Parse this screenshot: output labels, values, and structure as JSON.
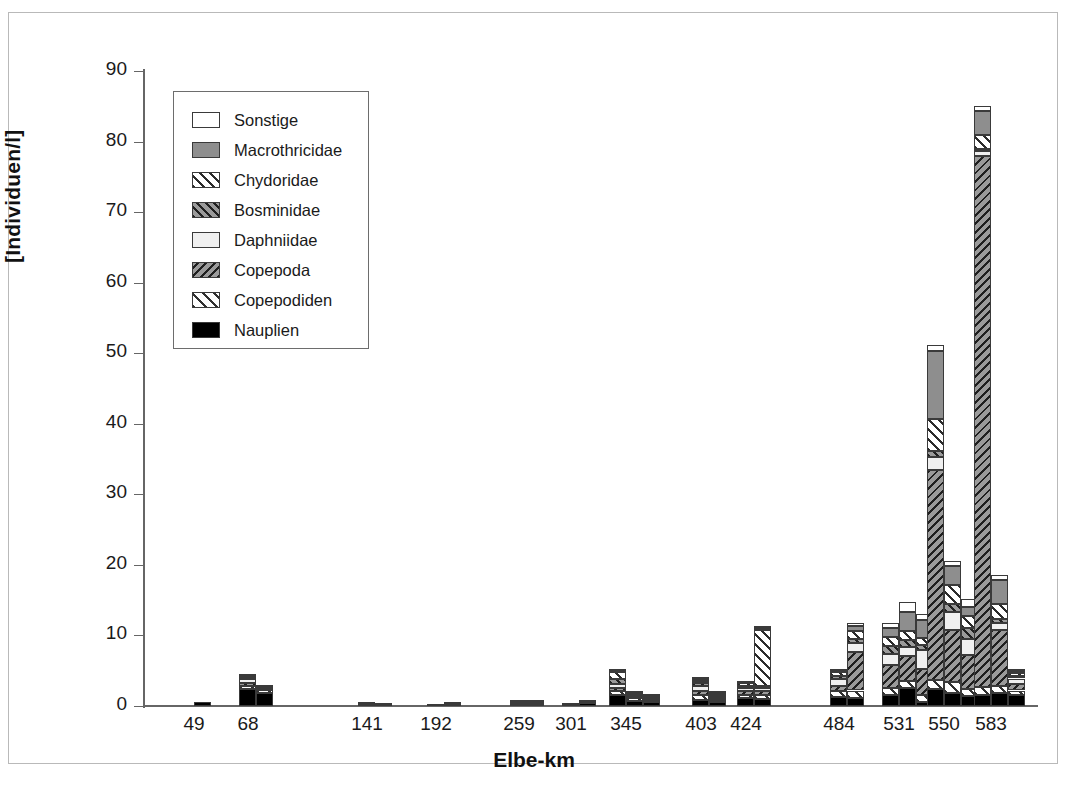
{
  "chart_data": {
    "type": "bar",
    "title": "",
    "subtitle": "",
    "xlabel": "Elbe-km",
    "ylabel": "[Individuen/l]",
    "ylim": [
      0,
      90
    ],
    "yticks": [
      0,
      10,
      20,
      30,
      40,
      50,
      60,
      70,
      80,
      90
    ],
    "grid": false,
    "stacked": true,
    "legend_position": "upper-left",
    "categories": [
      "49",
      "68",
      "141",
      "192",
      "259",
      "301",
      "345",
      "403",
      "424",
      "484",
      "531",
      "550",
      "583"
    ],
    "series": [
      {
        "name": "Sonstige",
        "color": "#ffffff",
        "pattern": "solid"
      },
      {
        "name": "Macrothricidae",
        "color": "#8e8e8e",
        "pattern": "solid"
      },
      {
        "name": "Chydoridae",
        "color": "#ffffff",
        "pattern": "hatch-forward"
      },
      {
        "name": "Bosminidae",
        "color": "#9a9a9a",
        "pattern": "hatch-forward"
      },
      {
        "name": "Daphniidae",
        "color": "#f0f0f0",
        "pattern": "solid"
      },
      {
        "name": "Copepoda",
        "color": "#9a9a9a",
        "pattern": "hatch-back"
      },
      {
        "name": "Copepodiden",
        "color": "#ffffff",
        "pattern": "hatch-forward"
      },
      {
        "name": "Nauplien",
        "color": "#000000",
        "pattern": "solid"
      }
    ],
    "stack_order_bottom_to_top": [
      "Nauplien",
      "Copepodiden",
      "Copepoda",
      "Daphniidae",
      "Bosminidae",
      "Chydoridae",
      "Macrothricidae",
      "Sonstige"
    ],
    "groups": [
      {
        "category": "49",
        "bars": [
          {
            "values": {
              "Nauplien": 0.6,
              "Copepodiden": 0.0,
              "Copepoda": 0.0,
              "Daphniidae": 0.0,
              "Bosminidae": 0.0,
              "Chydoridae": 0.0,
              "Macrothricidae": 0.0,
              "Sonstige": 0.0
            },
            "total": 0.6
          }
        ]
      },
      {
        "category": "68",
        "bars": [
          {
            "values": {
              "Nauplien": 2.4,
              "Copepodiden": 0.5,
              "Copepoda": 0.3,
              "Daphniidae": 0.6,
              "Bosminidae": 0.2,
              "Chydoridae": 0.2,
              "Macrothricidae": 0.0,
              "Sonstige": 0.3
            },
            "total": 4.5
          },
          {
            "values": {
              "Nauplien": 1.9,
              "Copepodiden": 0.4,
              "Copepoda": 0.2,
              "Daphniidae": 0.2,
              "Bosminidae": 0.0,
              "Chydoridae": 0.0,
              "Macrothricidae": 0.0,
              "Sonstige": 0.1
            },
            "total": 2.8
          }
        ]
      },
      {
        "category": "141",
        "bars": [
          {
            "values": {
              "Nauplien": 0.25,
              "Copepodiden": 0.05,
              "Copepoda": 0.0,
              "Daphniidae": 0.0,
              "Bosminidae": 0.0,
              "Chydoridae": 0.0,
              "Macrothricidae": 0.0,
              "Sonstige": 0.0
            },
            "total": 0.3
          },
          {
            "values": {
              "Nauplien": 0.2,
              "Copepodiden": 0.05,
              "Copepoda": 0.0,
              "Daphniidae": 0.0,
              "Bosminidae": 0.0,
              "Chydoridae": 0.0,
              "Macrothricidae": 0.0,
              "Sonstige": 0.0
            },
            "total": 0.25
          }
        ]
      },
      {
        "category": "192",
        "bars": [
          {
            "values": {
              "Nauplien": 0.2,
              "Copepodiden": 0.0,
              "Copepoda": 0.0,
              "Daphniidae": 0.0,
              "Bosminidae": 0.0,
              "Chydoridae": 0.0,
              "Macrothricidae": 0.0,
              "Sonstige": 0.0
            },
            "total": 0.2
          },
          {
            "values": {
              "Nauplien": 0.35,
              "Copepodiden": 0.1,
              "Copepoda": 0.0,
              "Daphniidae": 0.0,
              "Bosminidae": 0.0,
              "Chydoridae": 0.0,
              "Macrothricidae": 0.0,
              "Sonstige": 0.0
            },
            "total": 0.45
          }
        ]
      },
      {
        "category": "259",
        "bars": [
          {
            "values": {
              "Nauplien": 0.35,
              "Copepodiden": 0.1,
              "Copepoda": 0.05,
              "Daphniidae": 0.1,
              "Bosminidae": 0.0,
              "Chydoridae": 0.0,
              "Macrothricidae": 0.0,
              "Sonstige": 0.05
            },
            "total": 0.65
          },
          {
            "values": {
              "Nauplien": 0.3,
              "Copepodiden": 0.1,
              "Copepoda": 0.05,
              "Daphniidae": 0.1,
              "Bosminidae": 0.0,
              "Chydoridae": 0.0,
              "Macrothricidae": 0.0,
              "Sonstige": 0.05
            },
            "total": 0.6
          }
        ]
      },
      {
        "category": "301",
        "bars": [
          {
            "values": {
              "Nauplien": 0.2,
              "Copepodiden": 0.1,
              "Copepoda": 0.0,
              "Daphniidae": 0.0,
              "Bosminidae": 0.0,
              "Chydoridae": 0.0,
              "Macrothricidae": 0.0,
              "Sonstige": 0.0
            },
            "total": 0.3
          },
          {
            "values": {
              "Nauplien": 0.4,
              "Copepodiden": 0.1,
              "Copepoda": 0.05,
              "Daphniidae": 0.0,
              "Bosminidae": 0.0,
              "Chydoridae": 0.0,
              "Macrothricidae": 0.0,
              "Sonstige": 0.0
            },
            "total": 0.55
          }
        ]
      },
      {
        "category": "345",
        "bars": [
          {
            "values": {
              "Nauplien": 1.6,
              "Copepodiden": 0.5,
              "Copepoda": 0.5,
              "Daphniidae": 0.5,
              "Bosminidae": 0.7,
              "Chydoridae": 1.0,
              "Macrothricidae": 0.2,
              "Sonstige": 0.2
            },
            "total": 5.2
          },
          {
            "values": {
              "Nauplien": 0.7,
              "Copepodiden": 0.4,
              "Copepoda": 0.3,
              "Daphniidae": 0.3,
              "Bosminidae": 0.2,
              "Chydoridae": 0.1,
              "Macrothricidae": 0.0,
              "Sonstige": 0.0
            },
            "total": 2.0
          },
          {
            "values": {
              "Nauplien": 0.5,
              "Copepodiden": 0.3,
              "Copepoda": 0.2,
              "Daphniidae": 0.2,
              "Bosminidae": 0.1,
              "Chydoridae": 0.1,
              "Macrothricidae": 0.0,
              "Sonstige": 0.1
            },
            "total": 1.5
          }
        ]
      },
      {
        "category": "403",
        "bars": [
          {
            "values": {
              "Nauplien": 0.9,
              "Copepodiden": 0.6,
              "Copepoda": 0.6,
              "Daphniidae": 0.7,
              "Bosminidae": 0.4,
              "Chydoridae": 0.4,
              "Macrothricidae": 0.2,
              "Sonstige": 0.2
            },
            "total": 4.0
          },
          {
            "values": {
              "Nauplien": 0.5,
              "Copepodiden": 0.3,
              "Copepoda": 0.3,
              "Daphniidae": 0.3,
              "Bosminidae": 0.2,
              "Chydoridae": 0.2,
              "Macrothricidae": 0.0,
              "Sonstige": 0.1
            },
            "total": 1.9
          }
        ]
      },
      {
        "category": "424",
        "bars": [
          {
            "values": {
              "Nauplien": 1.1,
              "Copepodiden": 0.5,
              "Copepoda": 0.5,
              "Daphniidae": 0.5,
              "Bosminidae": 0.3,
              "Chydoridae": 0.3,
              "Macrothricidae": 0.1,
              "Sonstige": 0.1
            },
            "total": 3.4
          },
          {
            "values": {
              "Nauplien": 1.0,
              "Copepodiden": 0.5,
              "Copepoda": 0.6,
              "Daphniidae": 0.4,
              "Bosminidae": 0.3,
              "Chydoridae": 8.0,
              "Macrothricidae": 0.2,
              "Sonstige": 0.2
            },
            "total": 11.2
          }
        ]
      },
      {
        "category": "484",
        "bars": [
          {
            "values": {
              "Nauplien": 1.3,
              "Copepodiden": 0.8,
              "Copepoda": 0.8,
              "Daphniidae": 0.9,
              "Bosminidae": 0.5,
              "Chydoridae": 0.5,
              "Macrothricidae": 0.2,
              "Sonstige": 0.2
            },
            "total": 5.2
          },
          {
            "values": {
              "Nauplien": 1.2,
              "Copepodiden": 1.0,
              "Copepoda": 5.5,
              "Daphniidae": 1.2,
              "Bosminidae": 0.6,
              "Chydoridae": 1.2,
              "Macrothricidae": 0.6,
              "Sonstige": 0.5
            },
            "total": 11.8
          }
        ]
      },
      {
        "category": "531",
        "bars": [
          {
            "values": {
              "Nauplien": 1.6,
              "Copepodiden": 1.0,
              "Copepoda": 3.2,
              "Daphniidae": 1.6,
              "Bosminidae": 1.1,
              "Chydoridae": 1.3,
              "Macrothricidae": 1.2,
              "Sonstige": 0.8
            },
            "total": 11.8
          },
          {
            "values": {
              "Nauplien": 2.6,
              "Copepodiden": 0.9,
              "Copepoda": 3.6,
              "Daphniidae": 1.3,
              "Bosminidae": 0.9,
              "Chydoridae": 1.4,
              "Macrothricidae": 2.6,
              "Sonstige": 1.4
            },
            "total": 14.7
          },
          {
            "values": {
              "Nauplien": 0.6,
              "Copepodiden": 0.9,
              "Copepoda": 3.8,
              "Daphniidae": 2.6,
              "Bosminidae": 0.8,
              "Chydoridae": 0.9,
              "Macrothricidae": 2.6,
              "Sonstige": 0.8
            },
            "total": 13.0
          }
        ]
      },
      {
        "category": "550",
        "bars": [
          {
            "values": {
              "Nauplien": 2.4,
              "Copepodiden": 1.3,
              "Copepoda": 29.8,
              "Daphniidae": 1.8,
              "Bosminidae": 0.9,
              "Chydoridae": 4.5,
              "Macrothricidae": 9.6,
              "Sonstige": 0.8
            },
            "total": 51.1
          },
          {
            "values": {
              "Nauplien": 1.9,
              "Copepodiden": 1.5,
              "Copepoda": 7.4,
              "Daphniidae": 2.5,
              "Bosminidae": 1.1,
              "Chydoridae": 2.7,
              "Macrothricidae": 2.8,
              "Sonstige": 0.6
            },
            "total": 20.5
          },
          {
            "values": {
              "Nauplien": 1.4,
              "Copepodiden": 1.0,
              "Copepoda": 4.8,
              "Daphniidae": 2.3,
              "Bosminidae": 1.6,
              "Chydoridae": 1.6,
              "Macrothricidae": 1.4,
              "Sonstige": 1.1
            },
            "total": 15.2
          }
        ]
      },
      {
        "category": "583",
        "bars": [
          {
            "values": {
              "Nauplien": 1.5,
              "Copepodiden": 1.2,
              "Copepoda": 75.3,
              "Daphniidae": 0.6,
              "Bosminidae": 0.4,
              "Chydoridae": 2.0,
              "Macrothricidae": 3.4,
              "Sonstige": 0.6
            },
            "total": 85.0
          },
          {
            "values": {
              "Nauplien": 1.8,
              "Copepodiden": 1.0,
              "Copepoda": 8.0,
              "Daphniidae": 1.0,
              "Bosminidae": 0.6,
              "Chydoridae": 2.0,
              "Macrothricidae": 3.4,
              "Sonstige": 0.7
            },
            "total": 18.5
          },
          {
            "values": {
              "Nauplien": 1.6,
              "Copepodiden": 0.6,
              "Copepoda": 0.9,
              "Daphniidae": 0.8,
              "Bosminidae": 0.4,
              "Chydoridae": 0.4,
              "Macrothricidae": 0.3,
              "Sonstige": 0.2
            },
            "total": 5.2
          }
        ]
      }
    ]
  },
  "axis": {
    "y_title": "[Individuen/l]",
    "x_title": "Elbe-km"
  },
  "legend": {
    "items": [
      {
        "label": "Sonstige",
        "key": "Sonstige"
      },
      {
        "label": "Macrothricidae",
        "key": "Macrothricidae"
      },
      {
        "label": "Chydoridae",
        "key": "Chydoridae"
      },
      {
        "label": "Bosminidae",
        "key": "Bosminidae"
      },
      {
        "label": "Daphniidae",
        "key": "Daphniidae"
      },
      {
        "label": "Copepoda",
        "key": "Copepoda"
      },
      {
        "label": "Copepodiden",
        "key": "Copepodiden"
      },
      {
        "label": "Nauplien",
        "key": "Nauplien"
      }
    ]
  }
}
